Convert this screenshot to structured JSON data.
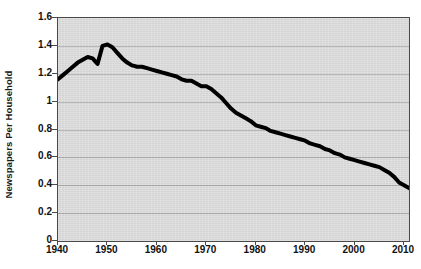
{
  "chart_data": {
    "type": "line",
    "title": "",
    "subtitle": "",
    "xlabel": "",
    "ylabel": "Newspapers Per Household",
    "xlim": [
      1940,
      2011
    ],
    "ylim": [
      0,
      1.6
    ],
    "grid": true,
    "legend": false,
    "legend_position": "none",
    "xticks": [
      1940,
      1950,
      1960,
      1970,
      1980,
      1990,
      2000,
      2010
    ],
    "xtick_labels": [
      "1940",
      "1950",
      "1960",
      "1970",
      "1980",
      "1990",
      "2000",
      "2010"
    ],
    "yticks": [
      0,
      0.2,
      0.4,
      0.6,
      0.8,
      1,
      1.2,
      1.4,
      1.6
    ],
    "ytick_labels": [
      "0",
      "0.2",
      "0.4",
      "0.6",
      "0.8",
      "1",
      "1.2",
      "1.4",
      "1.6"
    ],
    "series": [
      {
        "name": "Newspapers Per Household",
        "color": "#000000",
        "line_width": 4,
        "markers": false,
        "x": [
          1940,
          1941,
          1942,
          1943,
          1944,
          1945,
          1946,
          1947,
          1948,
          1949,
          1950,
          1951,
          1952,
          1953,
          1954,
          1955,
          1956,
          1957,
          1958,
          1959,
          1960,
          1961,
          1962,
          1963,
          1964,
          1965,
          1966,
          1967,
          1968,
          1969,
          1970,
          1971,
          1972,
          1973,
          1974,
          1975,
          1976,
          1977,
          1978,
          1979,
          1980,
          1981,
          1982,
          1983,
          1984,
          1985,
          1986,
          1987,
          1988,
          1989,
          1990,
          1991,
          1992,
          1993,
          1994,
          1995,
          1996,
          1997,
          1998,
          1999,
          2000,
          2001,
          2002,
          2003,
          2004,
          2005,
          2006,
          2007,
          2008,
          2009,
          2010,
          2011
        ],
        "values": [
          1.16,
          1.19,
          1.22,
          1.25,
          1.28,
          1.3,
          1.32,
          1.31,
          1.27,
          1.4,
          1.41,
          1.39,
          1.35,
          1.31,
          1.28,
          1.26,
          1.25,
          1.25,
          1.24,
          1.23,
          1.22,
          1.21,
          1.2,
          1.19,
          1.18,
          1.16,
          1.15,
          1.15,
          1.13,
          1.11,
          1.11,
          1.09,
          1.06,
          1.03,
          0.99,
          0.95,
          0.92,
          0.9,
          0.88,
          0.86,
          0.83,
          0.82,
          0.81,
          0.79,
          0.78,
          0.77,
          0.76,
          0.75,
          0.74,
          0.73,
          0.72,
          0.7,
          0.69,
          0.68,
          0.66,
          0.65,
          0.63,
          0.62,
          0.6,
          0.59,
          0.58,
          0.57,
          0.56,
          0.55,
          0.54,
          0.53,
          0.51,
          0.49,
          0.46,
          0.42,
          0.4,
          0.38
        ]
      }
    ],
    "annotations": [],
    "notable_points": {
      "start_year": 1940,
      "start_value": 1.16,
      "peak_year": 1950,
      "peak_value": 1.41,
      "end_year": 2011,
      "end_value": 0.38
    }
  },
  "colors": {
    "plot_background": "#d9d9d9",
    "page_background": "#ffffff",
    "gridline": "#a8a8a8",
    "axis": "#4a4a4a",
    "series_line": "#000000",
    "text": "#111111"
  }
}
